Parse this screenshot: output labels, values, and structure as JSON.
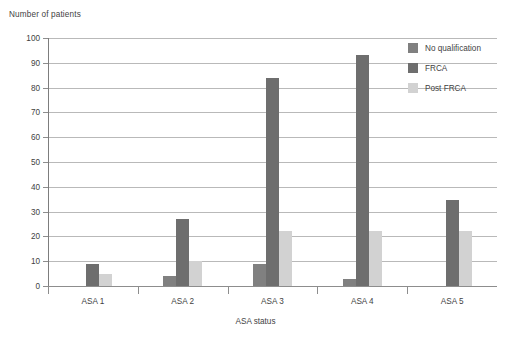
{
  "chart_data": {
    "type": "bar",
    "title": "",
    "subtitle": "",
    "xlabel": "ASA status",
    "ylabel": "Number of patients",
    "categories": [
      "ASA 1",
      "ASA 2",
      "ASA 3",
      "ASA 4",
      "ASA 5"
    ],
    "series": [
      {
        "name": "No qualification",
        "color": "#808080",
        "values": [
          0,
          4,
          9,
          3,
          0
        ]
      },
      {
        "name": "FRCA",
        "color": "#6e6e6e",
        "values": [
          9,
          27,
          84,
          93,
          34.5
        ]
      },
      {
        "name": "Post FRCA",
        "color": "#d2d2d2",
        "values": [
          5,
          10,
          22,
          22,
          22
        ]
      }
    ],
    "ylim": [
      0,
      100
    ],
    "ytick_step": 10,
    "yticks": [
      0,
      10,
      20,
      30,
      40,
      50,
      60,
      70,
      80,
      90,
      100
    ],
    "ytick_labels": [
      "0",
      "10",
      "20",
      "30",
      "40",
      "50",
      "60",
      "70",
      "80",
      "90",
      "100"
    ],
    "grid": true,
    "grid_axis": "y",
    "legend_position": "top-right",
    "background": "#ffffff",
    "grid_color": "#b9b9b9",
    "axis_color": "#8d8d8d",
    "text_color": "#3f3f3f"
  },
  "legend": {
    "items": [
      {
        "label": "No qualification",
        "color": "#808080"
      },
      {
        "label": "FRCA",
        "color": "#6e6e6e"
      },
      {
        "label": "Post FRCA",
        "color": "#d2d2d2"
      }
    ]
  },
  "axes": {
    "y_title": "Number of patients",
    "x_title": "ASA status"
  }
}
